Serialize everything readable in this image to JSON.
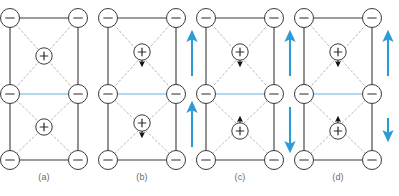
{
  "figure": {
    "width": 399,
    "height": 196,
    "background": "#ffffff"
  },
  "style": {
    "solid_edge_color": "#3a3a3a",
    "dashed_diagonal_color": "#b9b9b9",
    "blue_line_color": "#9ccbe8",
    "blue_arrow_color": "#2e9bd6",
    "ion_outline_color": "#3a3a3a",
    "ion_fill_color": "#ffffff",
    "sign_color": "#2b2b2b",
    "dipole_color": "#111111",
    "caption_color": "#6a6a6a"
  },
  "legend": {
    "anion_symbol": "−",
    "cation_symbol": "+",
    "anion_name": "negative-ion",
    "cation_name": "positive-ion"
  },
  "panels": [
    {
      "id": "a",
      "caption": "(a)",
      "origin_x": 10,
      "cell_width": 68,
      "cations": [
        {
          "position": "upper",
          "dipole": "none"
        },
        {
          "position": "lower",
          "dipole": "none"
        }
      ],
      "blue_arrows": []
    },
    {
      "id": "b",
      "caption": "(b)",
      "origin_x": 108,
      "cell_width": 68,
      "cations": [
        {
          "position": "upper",
          "dipole": "down"
        },
        {
          "position": "lower",
          "dipole": "down"
        }
      ],
      "blue_arrows": [
        {
          "position": "upper",
          "direction": "up",
          "length": "long"
        },
        {
          "position": "lower",
          "direction": "up",
          "length": "long"
        }
      ]
    },
    {
      "id": "c",
      "caption": "(c)",
      "origin_x": 206,
      "cell_width": 68,
      "cations": [
        {
          "position": "upper",
          "dipole": "down"
        },
        {
          "position": "lower",
          "dipole": "up"
        }
      ],
      "blue_arrows": [
        {
          "position": "upper",
          "direction": "up",
          "length": "long"
        },
        {
          "position": "lower",
          "direction": "down",
          "length": "long"
        }
      ]
    },
    {
      "id": "d",
      "caption": "(d)",
      "origin_x": 304,
      "cell_width": 68,
      "cations": [
        {
          "position": "upper",
          "dipole": "down"
        },
        {
          "position": "lower",
          "dipole": "up"
        }
      ],
      "blue_arrows": [
        {
          "position": "upper",
          "direction": "up",
          "length": "long"
        },
        {
          "position": "lower",
          "direction": "down",
          "length": "short"
        }
      ]
    }
  ],
  "captions": {
    "a": "(a)",
    "b": "(b)",
    "c": "(c)",
    "d": "(d)"
  }
}
